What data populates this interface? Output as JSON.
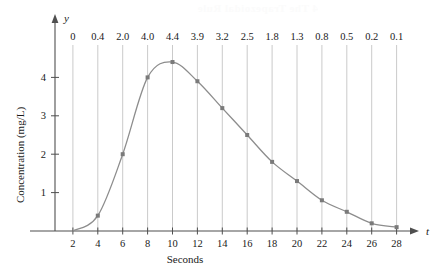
{
  "chart_data": {
    "type": "line",
    "title": "",
    "subtitle": "",
    "xlabel": "Seconds",
    "ylabel": "Concentration (mg/L)",
    "x_axis_symbol": "t",
    "y_axis_symbol": "y",
    "xlim": [
      0,
      29.5
    ],
    "ylim": [
      0,
      4.9
    ],
    "grid": true,
    "grid_description": "vertical gridlines at every labelled t value",
    "legend": "none",
    "x": [
      2,
      4,
      6,
      8,
      10,
      12,
      14,
      16,
      18,
      20,
      22,
      24,
      26,
      28
    ],
    "values": [
      0,
      0.4,
      2.0,
      4.0,
      4.4,
      3.9,
      3.2,
      2.5,
      1.8,
      1.3,
      0.8,
      0.5,
      0.2,
      0.1
    ],
    "point_labels": [
      "0",
      "0.4",
      "2.0",
      "4.0",
      "4.4",
      "3.9",
      "3.2",
      "2.5",
      "1.8",
      "1.3",
      "0.8",
      "0.5",
      "0.2",
      "0.1"
    ],
    "xticks": [
      2,
      4,
      6,
      8,
      10,
      12,
      14,
      16,
      18,
      20,
      22,
      24,
      26,
      28
    ],
    "xticklabels": [
      "2",
      "4",
      "6",
      "8",
      "10",
      "12",
      "14",
      "16",
      "18",
      "20",
      "22",
      "24",
      "26",
      "28"
    ],
    "yticks": [
      1,
      2,
      3,
      4
    ],
    "yticklabels": [
      "1",
      "2",
      "3",
      "4"
    ],
    "colors": {
      "curve": "#8d8d8d",
      "marker": "#7a7a7a",
      "grid": "#bdbdbd",
      "axis": "#4f4f4f",
      "text": "#1a1a1a"
    },
    "marker_shape": "square"
  },
  "page_bleed_text": "4 The Trapezoidal Rule"
}
